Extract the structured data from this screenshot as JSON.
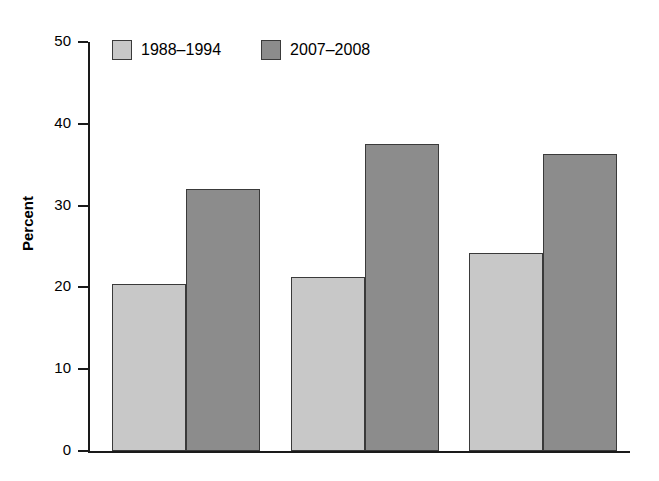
{
  "figure": {
    "top_caption_remnant": "",
    "background_color": "#ffffff"
  },
  "axis": {
    "ylabel": "Percent",
    "yticks": [
      "0",
      "10",
      "20",
      "30",
      "40",
      "50"
    ],
    "xticks": []
  },
  "legend": {
    "items": [
      {
        "label": "1988–1994",
        "color": "#c8c8c8",
        "swatch": "legend-swatch-light"
      },
      {
        "label": "2007–2008",
        "color": "#8c8c8c",
        "swatch": "legend-swatch-dark"
      }
    ]
  },
  "chart_data": {
    "type": "bar",
    "title": "",
    "xlabel": "",
    "ylabel": "Percent",
    "ylim": [
      0,
      50
    ],
    "ytick_values": [
      0,
      10,
      20,
      30,
      40,
      50
    ],
    "grid": false,
    "legend_position": "top-left-inside",
    "categories": [
      "Group 1",
      "Group 2",
      "Group 3"
    ],
    "category_labels_visible": false,
    "series": [
      {
        "name": "1988–1994",
        "color": "#c8c8c8",
        "values": [
          20.4,
          21.3,
          24.2
        ]
      },
      {
        "name": "2007–2008",
        "color": "#8c8c8c",
        "values": [
          32.0,
          37.5,
          36.3
        ]
      }
    ]
  },
  "geometry": {
    "plot_left": 88,
    "plot_baseline_y": 451,
    "plot_top_y": 42,
    "px_per_unit": 8.18,
    "bar_width": 74,
    "group_starts": [
      112,
      291,
      469
    ]
  }
}
